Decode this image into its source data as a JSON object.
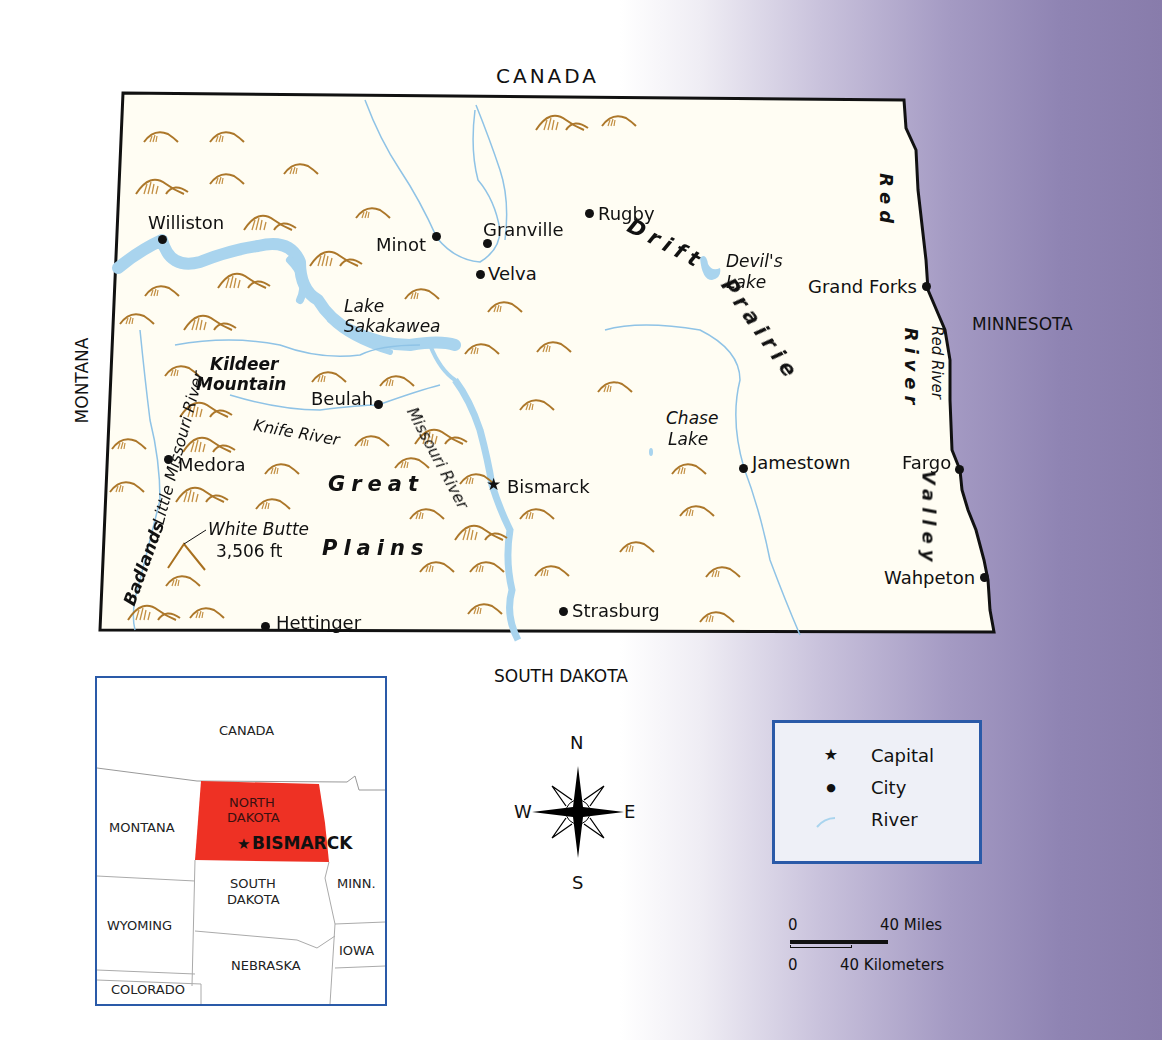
{
  "map": {
    "neighbors": {
      "north": "CANADA",
      "south": "SOUTH DAKOTA",
      "west": "MONTANA",
      "east": "MINNESOTA"
    },
    "capital": {
      "name": "Bismarck",
      "symbol": "★"
    },
    "cities": [
      {
        "name": "Williston"
      },
      {
        "name": "Minot"
      },
      {
        "name": "Granville"
      },
      {
        "name": "Velva"
      },
      {
        "name": "Rugby"
      },
      {
        "name": "Grand Forks"
      },
      {
        "name": "Beulah"
      },
      {
        "name": "Medora"
      },
      {
        "name": "Jamestown"
      },
      {
        "name": "Fargo"
      },
      {
        "name": "Wahpeton"
      },
      {
        "name": "Strasburg"
      },
      {
        "name": "Hettinger"
      }
    ],
    "water": {
      "lake_sakakawea": [
        "Lake",
        "Sakakawea"
      ],
      "devils_lake": [
        "Devil's",
        "Lake"
      ],
      "chase_lake": [
        "Chase",
        "Lake"
      ],
      "missouri_river": "Missouri River",
      "little_missouri_river": "Little Missouri River",
      "knife_river": "Knife River",
      "red_river": "Red River"
    },
    "regions": {
      "drift_prairie": [
        "Drift",
        "Prairie"
      ],
      "great_plains": [
        "Great",
        "Plains"
      ],
      "red_river_valley": [
        "Red",
        "River",
        "Valley"
      ],
      "badlands": "Badlands",
      "kildeer_mountain": [
        "Kildeer",
        "Mountain"
      ]
    },
    "peak": {
      "name": "White Butte",
      "elevation": "3,506 ft"
    },
    "colors": {
      "land": "#fffdf3",
      "water": "#a9d4ee",
      "river": "#8fc3e6",
      "hills": "#b07a2a",
      "border": "#111111",
      "background_purple": "#887cab"
    }
  },
  "inset": {
    "labels": {
      "canada": "CANADA",
      "montana": "MONTANA",
      "north_dakota": [
        "NORTH",
        "DAKOTA"
      ],
      "bismarck": "BISMARCK",
      "south_dakota": [
        "SOUTH",
        "DAKOTA"
      ],
      "minn": "MINN.",
      "wyoming": "WYOMING",
      "nebraska": "NEBRASKA",
      "iowa": "IOWA",
      "colorado": "COLORADO"
    },
    "highlight_color": "#ee3124",
    "border_color": "#2a5aa8"
  },
  "compass": {
    "n": "N",
    "s": "S",
    "e": "E",
    "w": "W"
  },
  "legend": {
    "items": [
      {
        "symbol": "★",
        "label": "Capital"
      },
      {
        "symbol": "●",
        "label": "City"
      },
      {
        "symbol": "river-line",
        "label": "River"
      }
    ]
  },
  "scale": {
    "miles_start": "0",
    "miles_end": "40 Miles",
    "km_start": "0",
    "km_end": "40 Kilometers"
  }
}
